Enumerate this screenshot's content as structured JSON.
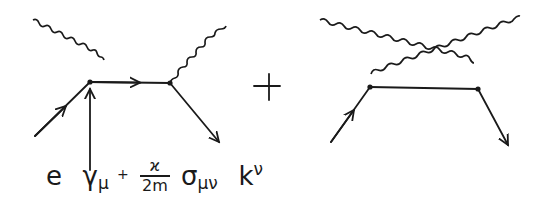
{
  "figure": {
    "type": "feynman_diagram",
    "colors": {
      "ink": "#1a1a1a",
      "background": "#ffffff"
    },
    "operator": "+",
    "vertex_label": {
      "e": "e",
      "gamma": "γ",
      "gamma_sub": "μ",
      "plus": "+",
      "frac_num": "ϰ",
      "frac_den": "2m",
      "sigma": "σ",
      "sigma_sub": "μν",
      "k": "k",
      "k_sup": "ν"
    },
    "diagrams": [
      {
        "name": "direct",
        "vertices": 2,
        "photons": 2,
        "fermion_lines": 3,
        "crossed": false
      },
      {
        "name": "crossed",
        "vertices": 2,
        "photons": 2,
        "fermion_lines": 3,
        "crossed": true
      }
    ]
  }
}
